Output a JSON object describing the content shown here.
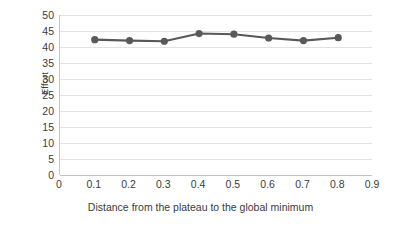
{
  "chart_data": {
    "type": "line",
    "title": "",
    "xlabel": "Distance from the plateau to the global minimum",
    "ylabel": "Effort",
    "xlim": [
      0,
      0.9
    ],
    "ylim": [
      0,
      50
    ],
    "grid": true,
    "legend": "none",
    "x_ticks": [
      "0",
      "0.1",
      "0.2",
      "0.3",
      "0.4",
      "0.5",
      "0.6",
      "0.7",
      "0.8",
      "0.9"
    ],
    "x_tick_values": [
      0,
      0.1,
      0.2,
      0.3,
      0.4,
      0.5,
      0.6,
      0.7,
      0.8,
      0.9
    ],
    "y_ticks": [
      "50",
      "45",
      "40",
      "35",
      "30",
      "25",
      "20",
      "15",
      "10",
      "5",
      "0"
    ],
    "y_tick_values": [
      50,
      45,
      40,
      35,
      30,
      25,
      20,
      15,
      10,
      5,
      0
    ],
    "x": [
      0.1,
      0.2,
      0.3,
      0.4,
      0.5,
      0.6,
      0.7,
      0.8
    ],
    "values": [
      42.3,
      42.0,
      41.8,
      44.2,
      44.0,
      42.8,
      42.0,
      42.9
    ],
    "series": [
      {
        "name": "Effort",
        "color": "#595959",
        "marker": "circle",
        "values": [
          42.3,
          42.0,
          41.8,
          44.2,
          44.0,
          42.8,
          42.0,
          42.9
        ]
      }
    ]
  },
  "style": {
    "series_color": "#595959",
    "gridline_color": "#e2e2e2",
    "axis_color": "#c2c2c2",
    "text_color": "#3b3b3b",
    "background": "#ffffff"
  }
}
